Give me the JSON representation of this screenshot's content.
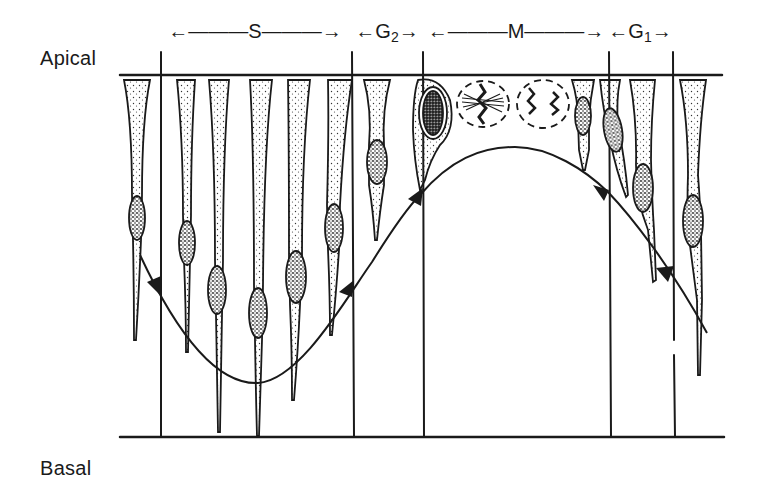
{
  "figure": {
    "axis_labels": {
      "top": "Apical",
      "bottom": "Basal"
    },
    "phases": [
      {
        "id": "S",
        "label": "S",
        "sub": "",
        "arrow_left": "←———",
        "arrow_right": "———→",
        "center_x": 255
      },
      {
        "id": "G2",
        "label": "G",
        "sub": "2",
        "arrow_left": "←",
        "arrow_right": "→",
        "center_x": 387
      },
      {
        "id": "M",
        "label": "M",
        "sub": "",
        "arrow_left": "←———",
        "arrow_right": "———→",
        "center_x": 516
      },
      {
        "id": "G1",
        "label": "G",
        "sub": "1",
        "arrow_left": "←",
        "arrow_right": "→",
        "center_x": 640
      }
    ],
    "phase_boundaries_x": [
      161,
      352,
      423,
      609,
      673
    ],
    "curve": {
      "description": "Sinusoidal trajectory of nucleus position with direction arrowheads",
      "arrowheads": [
        "down-left at S start",
        "up-right in S",
        "up-right at G2/M boundary",
        "down-right at M/G1 boundary",
        "down-right in G1"
      ]
    },
    "colors": {
      "ink": "#1a1a1a",
      "background": "#ffffff"
    }
  }
}
